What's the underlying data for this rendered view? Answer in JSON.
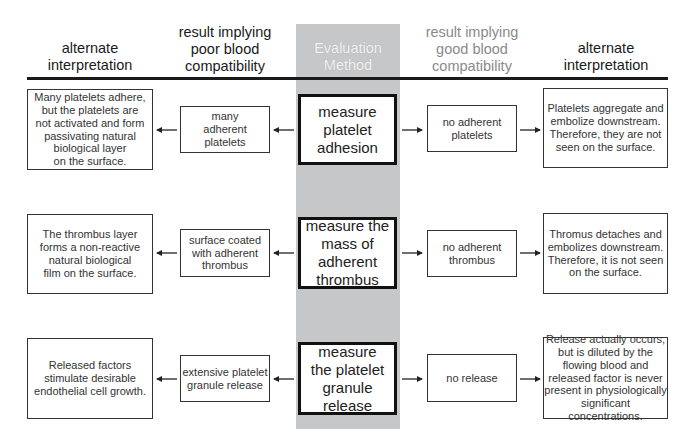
{
  "headers": {
    "left_alt": "alternate\ninterpretation",
    "poor": "result implying\npoor blood\ncompatibility",
    "method": "Evaluation\nMethod",
    "good": "result implying\ngood blood\ncompatibility",
    "right_alt": "alternate\ninterpretation"
  },
  "rows": [
    {
      "left_alt": "Many platelets adhere,\nbut the platelets are\nnot activated and form\npassivating natural\nbiological layer\non the surface.",
      "poor": "many\nadherent\nplatelets",
      "method": "measure\nplatelet\nadhesion",
      "good": "no adherent\nplatelets",
      "right_alt": "Platelets aggregate and\nembolize downstream.\nTherefore, they are not\nseen on the surface."
    },
    {
      "left_alt": "The thrombus layer\nforms a non-reactive\nnatural biological\nfilm on the surface.",
      "poor": "surface coated\nwith adherent\nthrombus",
      "method": "measure the\nmass of\nadherent\nthrombus",
      "good": "no adherent\nthrombus",
      "right_alt": "Thromus detaches and\nembolizes downstream.\nTherefore, it is not seen\non the surface."
    },
    {
      "left_alt": "Released factors\nstimulate desirable\nendothelial cell growth.",
      "poor": "extensive platelet\ngranule release",
      "method": "measure\nthe platelet\ngranule\nrelease",
      "good": "no release",
      "right_alt": "Release actually occurs,\nbut is diluted by the\nflowing blood and\nreleased factor is never\npresent in physiologically\nsignificant concentrations."
    }
  ],
  "arrows": {
    "left_direction": "left",
    "right_direction": "right"
  },
  "colors": {
    "method_column": "#c6c7c9",
    "good_header_text": "#8a8a8a",
    "rule": "#1a1a1a"
  }
}
